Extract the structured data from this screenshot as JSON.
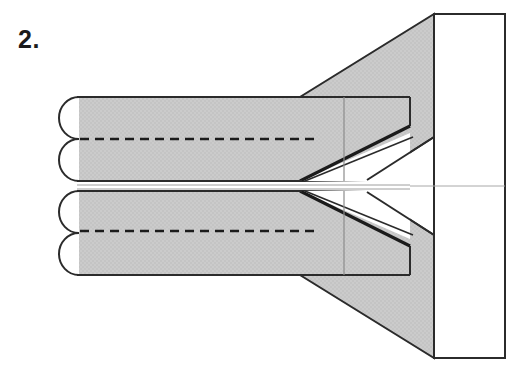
{
  "figure": {
    "step_label": "2.",
    "caption": "",
    "type": "origami-folding-diagram",
    "width": 524,
    "height": 382
  },
  "colors": {
    "paper_fill": "#c9c9c9",
    "paper_fill_light": "#cecece",
    "white_fill": "#ffffff",
    "outline": "#2b2b2b",
    "outline_soft": "#4a4a4a",
    "fold_dash": "#1b1b1b",
    "center_axis": "#9a9a9a",
    "background": "#ffffff",
    "text": "#1b1b1b"
  },
  "geometry": {
    "body": {
      "left": 77,
      "right": 410,
      "top": 97,
      "bottom": 274,
      "mid_top": 181,
      "mid_bottom": 191,
      "inner_vertical_line_x": 344
    },
    "loops": [
      {
        "name": "loop-upper-outer",
        "cx": 77,
        "cy": 118,
        "rx": 19,
        "ry": 21
      },
      {
        "name": "loop-upper-inner",
        "cx": 77,
        "cy": 160,
        "rx": 19,
        "ry": 21
      },
      {
        "name": "loop-lower-inner",
        "cx": 77,
        "cy": 212,
        "rx": 19,
        "ry": 21
      },
      {
        "name": "loop-lower-outer",
        "cx": 77,
        "cy": 254,
        "rx": 19,
        "ry": 21
      }
    ],
    "fold_lines": [
      {
        "name": "upper-valley-fold",
        "y": 139,
        "x1": 80,
        "x2": 318,
        "style": "dashed"
      },
      {
        "name": "lower-valley-fold",
        "y": 231,
        "x1": 80,
        "x2": 318,
        "style": "dashed"
      }
    ],
    "right_panel": {
      "left": 434,
      "right": 505,
      "top": 14,
      "bottom": 358
    },
    "flaps": {
      "upper_apex_x": 300,
      "lower_apex_x": 300,
      "apex_y_upper": 181,
      "apex_y_lower": 191
    },
    "center_axis_y": 186
  },
  "labels": {
    "step": "2.",
    "alt": "Origami step 2: a long shaded band with four rounded folded loops at the left, two dashed valley fold lines, converging to a point at the right where it meets a vertical rectangular panel."
  }
}
